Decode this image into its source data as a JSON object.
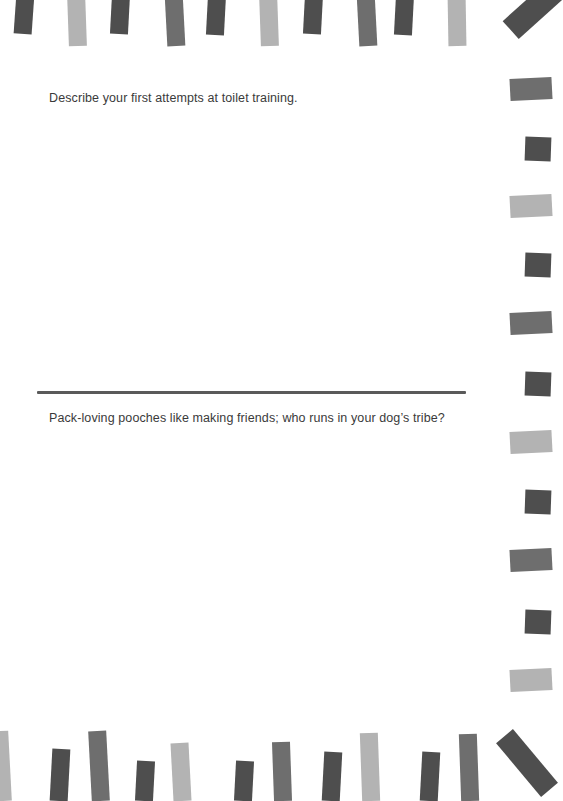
{
  "journal": {
    "prompts": [
      {
        "text": "Describe your first attempts at toilet training."
      },
      {
        "text": "Pack-loving pooches like making friends; who runs in your dog’s tribe?"
      }
    ]
  },
  "colors": {
    "stripe_dark": "#4e4e4e",
    "stripe_mid": "#6e6e6e",
    "stripe_light": "#b3b3b3",
    "divider": "#5a5a5a",
    "text": "#3a3a3a",
    "background": "#ffffff"
  }
}
